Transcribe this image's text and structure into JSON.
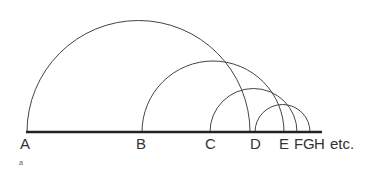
{
  "diagram": {
    "baseline": {
      "x1": 26,
      "x2": 322,
      "y": 132
    },
    "points": [
      {
        "label": "A",
        "x": 27
      },
      {
        "label": "B",
        "x": 142
      },
      {
        "label": "C",
        "x": 210
      },
      {
        "label": "D",
        "x": 255
      },
      {
        "label": "E",
        "x": 283
      },
      {
        "label": "F",
        "x": 297
      },
      {
        "label": "G",
        "x": 306
      },
      {
        "label": "H",
        "x": 314
      }
    ],
    "suffix": "etc.",
    "arcs": [
      {
        "from": 27,
        "to": 250
      },
      {
        "from": 142,
        "to": 284
      },
      {
        "from": 210,
        "to": 297
      },
      {
        "from": 255,
        "to": 310
      }
    ],
    "footnote": "a"
  }
}
